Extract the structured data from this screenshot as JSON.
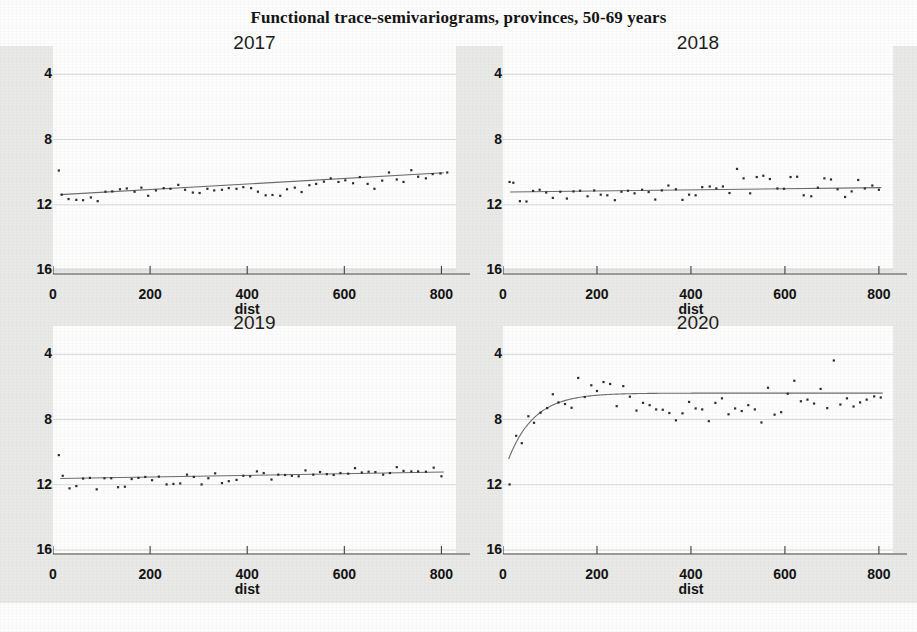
{
  "figure": {
    "title": "Functional trace-semivariograms, provinces, 50-69 years",
    "background_color": "#e9e9e7",
    "point_color": "#2b2b2b",
    "line_color": "#6b6b6b",
    "grid_color": "#d8d8d8"
  },
  "axis": {
    "x_name": "dist",
    "y_ticks": [
      "16",
      "12",
      "8",
      "4"
    ],
    "x_ticks": [
      "0",
      "200",
      "400",
      "600",
      "800"
    ]
  },
  "chart_data": {
    "type": "scatter",
    "title": "Functional trace-semivariograms, provinces, 50-69 years",
    "xlabel": "dist",
    "ylabel": "",
    "xlim": [
      0,
      830
    ],
    "ylim": [
      4,
      17
    ],
    "x_ticks": [
      0,
      200,
      400,
      600,
      800
    ],
    "y_ticks": [
      4,
      8,
      12,
      16
    ],
    "grid": true,
    "legend": "none",
    "panels": [
      {
        "name": "2017",
        "title": "2017",
        "model": "linear trend, no sill reached",
        "fit_line": {
          "type": "linear",
          "x": [
            15,
            805
          ],
          "y": [
            8.62,
            9.96
          ]
        },
        "points": [
          {
            "x": 12,
            "y": 10.1
          },
          {
            "x": 18,
            "y": 8.62
          },
          {
            "x": 32,
            "y": 8.35
          },
          {
            "x": 48,
            "y": 8.3
          },
          {
            "x": 62,
            "y": 8.28
          },
          {
            "x": 78,
            "y": 8.45
          },
          {
            "x": 92,
            "y": 8.22
          },
          {
            "x": 108,
            "y": 8.8
          },
          {
            "x": 122,
            "y": 8.82
          },
          {
            "x": 138,
            "y": 8.95
          },
          {
            "x": 152,
            "y": 9.0
          },
          {
            "x": 168,
            "y": 8.8
          },
          {
            "x": 182,
            "y": 9.05
          },
          {
            "x": 196,
            "y": 8.55
          },
          {
            "x": 212,
            "y": 8.88
          },
          {
            "x": 228,
            "y": 9.02
          },
          {
            "x": 242,
            "y": 8.98
          },
          {
            "x": 258,
            "y": 9.22
          },
          {
            "x": 272,
            "y": 8.92
          },
          {
            "x": 288,
            "y": 8.75
          },
          {
            "x": 302,
            "y": 8.72
          },
          {
            "x": 318,
            "y": 8.98
          },
          {
            "x": 332,
            "y": 8.88
          },
          {
            "x": 348,
            "y": 8.92
          },
          {
            "x": 362,
            "y": 9.02
          },
          {
            "x": 378,
            "y": 8.98
          },
          {
            "x": 392,
            "y": 9.08
          },
          {
            "x": 408,
            "y": 9.02
          },
          {
            "x": 422,
            "y": 8.8
          },
          {
            "x": 438,
            "y": 8.58
          },
          {
            "x": 452,
            "y": 8.6
          },
          {
            "x": 468,
            "y": 8.55
          },
          {
            "x": 482,
            "y": 8.95
          },
          {
            "x": 498,
            "y": 9.05
          },
          {
            "x": 512,
            "y": 8.78
          },
          {
            "x": 528,
            "y": 9.2
          },
          {
            "x": 542,
            "y": 9.28
          },
          {
            "x": 558,
            "y": 9.42
          },
          {
            "x": 572,
            "y": 9.62
          },
          {
            "x": 588,
            "y": 9.4
          },
          {
            "x": 602,
            "y": 9.5
          },
          {
            "x": 618,
            "y": 9.32
          },
          {
            "x": 632,
            "y": 9.7
          },
          {
            "x": 648,
            "y": 9.28
          },
          {
            "x": 662,
            "y": 8.98
          },
          {
            "x": 678,
            "y": 9.48
          },
          {
            "x": 692,
            "y": 9.98
          },
          {
            "x": 708,
            "y": 9.55
          },
          {
            "x": 722,
            "y": 9.4
          },
          {
            "x": 738,
            "y": 10.12
          },
          {
            "x": 752,
            "y": 9.72
          },
          {
            "x": 768,
            "y": 9.62
          },
          {
            "x": 782,
            "y": 9.88
          },
          {
            "x": 798,
            "y": 9.92
          },
          {
            "x": 812,
            "y": 9.98
          }
        ]
      },
      {
        "name": "2018",
        "title": "2018",
        "model": "nearly flat / weak trend",
        "fit_line": {
          "type": "linear",
          "x": [
            15,
            805
          ],
          "y": [
            8.78,
            9.05
          ]
        },
        "points": [
          {
            "x": 14,
            "y": 9.4
          },
          {
            "x": 22,
            "y": 9.35
          },
          {
            "x": 36,
            "y": 8.22
          },
          {
            "x": 50,
            "y": 8.2
          },
          {
            "x": 64,
            "y": 8.85
          },
          {
            "x": 78,
            "y": 8.92
          },
          {
            "x": 92,
            "y": 8.75
          },
          {
            "x": 106,
            "y": 8.42
          },
          {
            "x": 122,
            "y": 8.8
          },
          {
            "x": 136,
            "y": 8.38
          },
          {
            "x": 150,
            "y": 8.82
          },
          {
            "x": 164,
            "y": 8.86
          },
          {
            "x": 180,
            "y": 8.52
          },
          {
            "x": 194,
            "y": 8.88
          },
          {
            "x": 208,
            "y": 8.62
          },
          {
            "x": 222,
            "y": 8.58
          },
          {
            "x": 238,
            "y": 8.28
          },
          {
            "x": 252,
            "y": 8.8
          },
          {
            "x": 266,
            "y": 8.86
          },
          {
            "x": 280,
            "y": 8.7
          },
          {
            "x": 296,
            "y": 8.92
          },
          {
            "x": 310,
            "y": 8.78
          },
          {
            "x": 324,
            "y": 8.32
          },
          {
            "x": 338,
            "y": 8.88
          },
          {
            "x": 352,
            "y": 9.18
          },
          {
            "x": 368,
            "y": 8.95
          },
          {
            "x": 382,
            "y": 8.3
          },
          {
            "x": 396,
            "y": 8.62
          },
          {
            "x": 410,
            "y": 8.58
          },
          {
            "x": 424,
            "y": 9.08
          },
          {
            "x": 440,
            "y": 9.12
          },
          {
            "x": 454,
            "y": 9.0
          },
          {
            "x": 468,
            "y": 9.12
          },
          {
            "x": 482,
            "y": 8.72
          },
          {
            "x": 498,
            "y": 10.2
          },
          {
            "x": 512,
            "y": 9.62
          },
          {
            "x": 526,
            "y": 8.7
          },
          {
            "x": 540,
            "y": 9.7
          },
          {
            "x": 554,
            "y": 9.78
          },
          {
            "x": 568,
            "y": 9.58
          },
          {
            "x": 584,
            "y": 9.0
          },
          {
            "x": 598,
            "y": 8.98
          },
          {
            "x": 612,
            "y": 9.7
          },
          {
            "x": 626,
            "y": 9.72
          },
          {
            "x": 640,
            "y": 8.58
          },
          {
            "x": 656,
            "y": 8.52
          },
          {
            "x": 670,
            "y": 9.05
          },
          {
            "x": 684,
            "y": 9.62
          },
          {
            "x": 698,
            "y": 9.55
          },
          {
            "x": 712,
            "y": 8.95
          },
          {
            "x": 728,
            "y": 8.48
          },
          {
            "x": 742,
            "y": 8.82
          },
          {
            "x": 756,
            "y": 9.52
          },
          {
            "x": 770,
            "y": 9.0
          },
          {
            "x": 786,
            "y": 9.18
          },
          {
            "x": 800,
            "y": 8.92
          }
        ]
      },
      {
        "name": "2019",
        "title": "2019",
        "model": "nearly flat / weak trend",
        "fit_line": {
          "type": "linear",
          "x": [
            15,
            805
          ],
          "y": [
            8.38,
            8.78
          ]
        },
        "points": [
          {
            "x": 12,
            "y": 9.82
          },
          {
            "x": 20,
            "y": 8.55
          },
          {
            "x": 34,
            "y": 7.78
          },
          {
            "x": 48,
            "y": 7.92
          },
          {
            "x": 62,
            "y": 8.38
          },
          {
            "x": 76,
            "y": 8.42
          },
          {
            "x": 90,
            "y": 7.72
          },
          {
            "x": 106,
            "y": 8.4
          },
          {
            "x": 120,
            "y": 8.4
          },
          {
            "x": 134,
            "y": 7.85
          },
          {
            "x": 148,
            "y": 7.88
          },
          {
            "x": 162,
            "y": 8.35
          },
          {
            "x": 176,
            "y": 8.42
          },
          {
            "x": 190,
            "y": 8.48
          },
          {
            "x": 204,
            "y": 8.28
          },
          {
            "x": 218,
            "y": 8.5
          },
          {
            "x": 234,
            "y": 8.02
          },
          {
            "x": 248,
            "y": 8.05
          },
          {
            "x": 262,
            "y": 8.08
          },
          {
            "x": 276,
            "y": 8.62
          },
          {
            "x": 290,
            "y": 8.48
          },
          {
            "x": 306,
            "y": 8.02
          },
          {
            "x": 320,
            "y": 8.4
          },
          {
            "x": 334,
            "y": 8.7
          },
          {
            "x": 348,
            "y": 8.1
          },
          {
            "x": 362,
            "y": 8.22
          },
          {
            "x": 378,
            "y": 8.3
          },
          {
            "x": 392,
            "y": 8.55
          },
          {
            "x": 406,
            "y": 8.52
          },
          {
            "x": 420,
            "y": 8.82
          },
          {
            "x": 434,
            "y": 8.72
          },
          {
            "x": 450,
            "y": 8.32
          },
          {
            "x": 464,
            "y": 8.62
          },
          {
            "x": 478,
            "y": 8.6
          },
          {
            "x": 492,
            "y": 8.55
          },
          {
            "x": 506,
            "y": 8.52
          },
          {
            "x": 520,
            "y": 8.88
          },
          {
            "x": 536,
            "y": 8.62
          },
          {
            "x": 550,
            "y": 8.78
          },
          {
            "x": 564,
            "y": 8.65
          },
          {
            "x": 578,
            "y": 8.6
          },
          {
            "x": 592,
            "y": 8.72
          },
          {
            "x": 608,
            "y": 8.68
          },
          {
            "x": 622,
            "y": 9.02
          },
          {
            "x": 636,
            "y": 8.75
          },
          {
            "x": 650,
            "y": 8.8
          },
          {
            "x": 664,
            "y": 8.78
          },
          {
            "x": 680,
            "y": 8.62
          },
          {
            "x": 694,
            "y": 8.72
          },
          {
            "x": 708,
            "y": 9.08
          },
          {
            "x": 722,
            "y": 8.85
          },
          {
            "x": 738,
            "y": 8.82
          },
          {
            "x": 752,
            "y": 8.82
          },
          {
            "x": 768,
            "y": 8.8
          },
          {
            "x": 784,
            "y": 9.05
          },
          {
            "x": 800,
            "y": 8.52
          }
        ]
      },
      {
        "name": "2020",
        "title": "2020",
        "model": "exponential, nugget 8.6, sill 13.6, range ~55",
        "fit_line": {
          "type": "exponential",
          "nugget": 8.6,
          "sill": 13.62,
          "range": 55,
          "x": [
            12,
            808
          ]
        },
        "points": [
          {
            "x": 14,
            "y": 8.02
          },
          {
            "x": 28,
            "y": 11.0
          },
          {
            "x": 40,
            "y": 10.55
          },
          {
            "x": 54,
            "y": 12.2
          },
          {
            "x": 66,
            "y": 11.8
          },
          {
            "x": 80,
            "y": 12.42
          },
          {
            "x": 94,
            "y": 12.7
          },
          {
            "x": 106,
            "y": 13.55
          },
          {
            "x": 118,
            "y": 13.05
          },
          {
            "x": 132,
            "y": 12.95
          },
          {
            "x": 146,
            "y": 12.72
          },
          {
            "x": 160,
            "y": 14.55
          },
          {
            "x": 174,
            "y": 13.38
          },
          {
            "x": 188,
            "y": 14.1
          },
          {
            "x": 200,
            "y": 13.75
          },
          {
            "x": 214,
            "y": 14.3
          },
          {
            "x": 228,
            "y": 14.18
          },
          {
            "x": 242,
            "y": 12.82
          },
          {
            "x": 256,
            "y": 14.05
          },
          {
            "x": 270,
            "y": 13.4
          },
          {
            "x": 284,
            "y": 12.55
          },
          {
            "x": 298,
            "y": 13.02
          },
          {
            "x": 312,
            "y": 12.88
          },
          {
            "x": 326,
            "y": 12.62
          },
          {
            "x": 340,
            "y": 12.6
          },
          {
            "x": 354,
            "y": 12.4
          },
          {
            "x": 368,
            "y": 11.95
          },
          {
            "x": 382,
            "y": 12.38
          },
          {
            "x": 396,
            "y": 13.08
          },
          {
            "x": 410,
            "y": 12.68
          },
          {
            "x": 424,
            "y": 12.62
          },
          {
            "x": 438,
            "y": 11.9
          },
          {
            "x": 452,
            "y": 13.02
          },
          {
            "x": 466,
            "y": 13.3
          },
          {
            "x": 480,
            "y": 12.32
          },
          {
            "x": 494,
            "y": 12.68
          },
          {
            "x": 508,
            "y": 12.52
          },
          {
            "x": 522,
            "y": 12.88
          },
          {
            "x": 536,
            "y": 12.62
          },
          {
            "x": 550,
            "y": 11.82
          },
          {
            "x": 564,
            "y": 13.95
          },
          {
            "x": 578,
            "y": 12.3
          },
          {
            "x": 592,
            "y": 12.45
          },
          {
            "x": 606,
            "y": 13.58
          },
          {
            "x": 620,
            "y": 14.38
          },
          {
            "x": 634,
            "y": 13.12
          },
          {
            "x": 648,
            "y": 13.22
          },
          {
            "x": 662,
            "y": 12.98
          },
          {
            "x": 676,
            "y": 13.88
          },
          {
            "x": 690,
            "y": 12.7
          },
          {
            "x": 704,
            "y": 15.62
          },
          {
            "x": 718,
            "y": 12.92
          },
          {
            "x": 732,
            "y": 13.3
          },
          {
            "x": 746,
            "y": 12.8
          },
          {
            "x": 760,
            "y": 13.05
          },
          {
            "x": 774,
            "y": 13.22
          },
          {
            "x": 790,
            "y": 13.42
          },
          {
            "x": 804,
            "y": 13.35
          }
        ]
      }
    ]
  }
}
